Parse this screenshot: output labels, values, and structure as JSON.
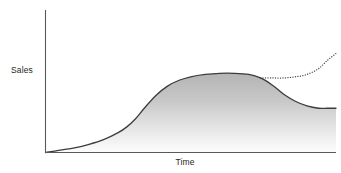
{
  "chart_data": {
    "type": "area",
    "title": "",
    "subtitle": "",
    "xlabel": "Time",
    "ylabel": "Sales",
    "grid": false,
    "legend": false,
    "axis_ticks": [],
    "xlim": [
      0,
      100
    ],
    "ylim": [
      0,
      100
    ],
    "annotations": [],
    "series": [
      {
        "name": "Sales",
        "style": "solid-filled-area",
        "color": "#3c3c3c",
        "fill_top_color": "#b6b6b6",
        "fill_bottom_color": "#fdfdfd",
        "x": [
          0,
          5,
          10,
          15,
          20,
          25,
          28,
          31,
          34,
          38,
          42,
          46,
          50,
          55,
          60,
          65,
          70,
          74,
          78,
          82,
          86,
          90,
          94,
          97,
          100
        ],
        "values": [
          0,
          2,
          4,
          7,
          11,
          17,
          22,
          29,
          38,
          49,
          57,
          62,
          65,
          67,
          68,
          68,
          67,
          64,
          58,
          50,
          44,
          40,
          38,
          38,
          38
        ]
      },
      {
        "name": "Extended Sales",
        "style": "dotted",
        "color": "#3c3c3c",
        "x": [
          74,
          78,
          82,
          86,
          90,
          94,
          97,
          100
        ],
        "values": [
          64,
          64,
          64,
          65,
          67,
          72,
          79,
          85
        ]
      }
    ]
  },
  "labels": {
    "y_axis": "Sales",
    "x_axis": "Time"
  },
  "colors": {
    "axis": "#5a5a5a",
    "curve": "#3c3c3c",
    "dotted": "#3c3c3c",
    "fill_top": "#b6b6b6",
    "fill_bottom": "#fdfdfd",
    "background": "#ffffff",
    "text": "#231f20"
  }
}
